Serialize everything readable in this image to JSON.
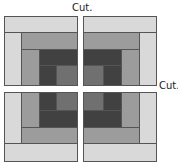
{
  "diagram": {
    "labels": {
      "top_cut": "Cut.",
      "right_cut": "Cut."
    },
    "colors": {
      "light": "#d9d9d9",
      "medium": "#9c9c9c",
      "medium_dark": "#707070",
      "dark": "#414141",
      "outline": "#555555"
    },
    "quadrants": [
      {
        "name": "top-left"
      },
      {
        "name": "top-right"
      },
      {
        "name": "bottom-left"
      },
      {
        "name": "bottom-right"
      }
    ]
  }
}
